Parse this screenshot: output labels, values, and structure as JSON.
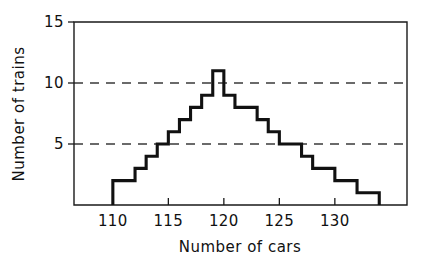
{
  "chart_data": {
    "type": "bar",
    "title": "",
    "subtitle": "",
    "xlabel": "Number of cars",
    "ylabel": "Number of trains",
    "xlim": [
      106.5,
      136.5
    ],
    "ylim": [
      0,
      15
    ],
    "xticks": [
      110,
      115,
      120,
      125,
      130
    ],
    "xtick_labels": [
      "110",
      "115",
      "120",
      "125",
      "130"
    ],
    "yticks": [
      5,
      10,
      15
    ],
    "ytick_labels": [
      "5",
      "10",
      "15"
    ],
    "gridlines_y": [
      5,
      10
    ],
    "grid": "horizontal-dashed-at-5-and-10",
    "legend": "none",
    "bin_width": 1,
    "style": "step-outline histogram, no fill, hand-drawn line art",
    "categories": [
      110,
      111,
      112,
      113,
      114,
      115,
      116,
      117,
      118,
      119,
      120,
      121,
      122,
      123,
      124,
      125,
      126,
      127,
      128,
      129,
      130,
      131,
      132,
      133
    ],
    "values": [
      2,
      2,
      3,
      4,
      5,
      6,
      7,
      8,
      9,
      11,
      9,
      8,
      8,
      7,
      6,
      5,
      5,
      4,
      3,
      3,
      2,
      2,
      1,
      1
    ],
    "annotations": [],
    "colors": {
      "line": "#111111",
      "grid": "#3a3a3a",
      "axis": "#1a1a1a",
      "background": "#ffffff"
    }
  },
  "axis_titles": {
    "x": "Number of cars",
    "y": "Number of trains"
  }
}
